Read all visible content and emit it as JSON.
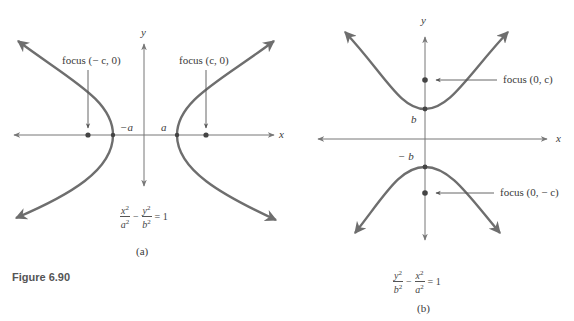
{
  "figure": {
    "caption": "Figure 6.90",
    "panel_a": {
      "label": "(a)",
      "axis_x": "x",
      "axis_y": "y",
      "vertex_left_label": "−a",
      "vertex_right_label": "a",
      "focus_left_label": "focus (− c, 0)",
      "focus_right_label": "focus (c, 0)",
      "equation": {
        "t1_num": "x",
        "t1_den": "a",
        "op": "−",
        "t2_num": "y",
        "t2_den": "b",
        "exp": "2",
        "rhs": "= 1"
      }
    },
    "panel_b": {
      "label": "(b)",
      "axis_x": "x",
      "axis_y": "y",
      "vertex_top_label": "b",
      "vertex_bottom_label": "− b",
      "focus_top_label": "focus (0, c)",
      "focus_bottom_label": "focus (0, − c)",
      "equation": {
        "t1_num": "y",
        "t1_den": "b",
        "op": "−",
        "t2_num": "x",
        "t2_den": "a",
        "exp": "2",
        "rhs": "= 1"
      }
    },
    "colors": {
      "curve": "#6e6e6e",
      "axis": "#777777",
      "text": "#3a3a3a"
    }
  }
}
